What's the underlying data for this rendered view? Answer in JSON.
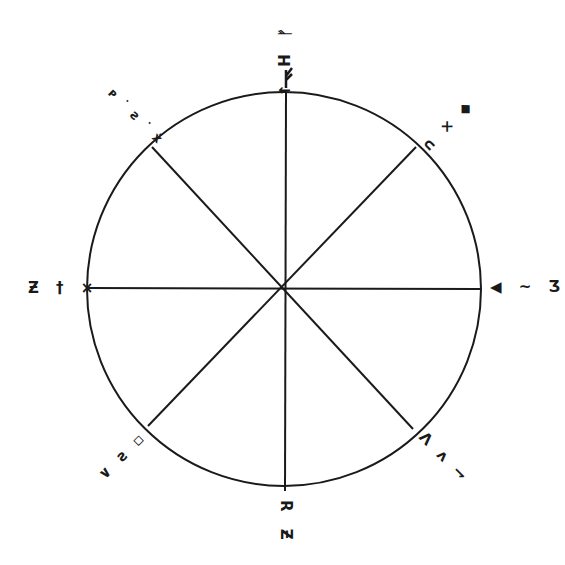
{
  "diagram": {
    "type": "compass-wheel",
    "stroke_color": "#1a1a1a",
    "background": "#ffffff",
    "center": {
      "x": 284,
      "y": 289
    },
    "radius": 197,
    "spokes": 8,
    "labels": {
      "north": {
        "glyphs": "↑ H ᚠ",
        "rotation": 0
      },
      "northeast": {
        "glyphs": "∩ × ◆",
        "rotation": 135
      },
      "east": {
        "glyphs": "◀ ~ Ʒ",
        "rotation": 90
      },
      "southeast": {
        "glyphs": "Ʌ ᴧ ⇁",
        "rotation": 45
      },
      "south": {
        "glyphs": "R Ƶ",
        "rotation": 180
      },
      "southwest": {
        "glyphs": "∨ ƨ ▫",
        "rotation": -45
      },
      "west": {
        "glyphs": "Ƶ † ×",
        "rotation": -90
      },
      "northwest": {
        "glyphs": "ᴩ ˙ ƨ ˙ ẋ",
        "rotation": -135
      }
    }
  }
}
